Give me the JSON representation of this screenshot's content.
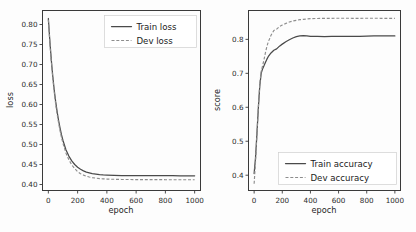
{
  "figure": {
    "background": "#fdfdfd",
    "panel_count": 2
  },
  "chart_data": [
    {
      "type": "line",
      "panel": "left",
      "title": "",
      "xlabel": "epoch",
      "ylabel": "loss",
      "xlim": [
        -40,
        1040
      ],
      "ylim": [
        0.385,
        0.835
      ],
      "xticks": [
        0,
        200,
        400,
        600,
        800,
        1000
      ],
      "xticklabels": [
        "0",
        "200",
        "400",
        "600",
        "800",
        "1000"
      ],
      "yticks": [
        0.4,
        0.45,
        0.5,
        0.55,
        0.6,
        0.65,
        0.7,
        0.75,
        0.8
      ],
      "yticklabels": [
        "0.40",
        "0.45",
        "0.50",
        "0.55",
        "0.60",
        "0.65",
        "0.70",
        "0.75",
        "0.80"
      ],
      "grid": false,
      "legend_position": "upper right",
      "legend": [
        "Train loss",
        "Dev loss"
      ],
      "x": [
        0,
        10,
        20,
        30,
        40,
        50,
        60,
        70,
        80,
        90,
        100,
        120,
        140,
        160,
        180,
        200,
        220,
        240,
        260,
        280,
        300,
        325,
        350,
        375,
        400,
        450,
        500,
        550,
        600,
        650,
        700,
        750,
        800,
        850,
        900,
        950,
        1000
      ],
      "series": [
        {
          "name": "Train loss",
          "style": "solid",
          "color": "#4a4a4a",
          "values": [
            0.815,
            0.76,
            0.712,
            0.672,
            0.637,
            0.607,
            0.582,
            0.56,
            0.541,
            0.524,
            0.51,
            0.487,
            0.471,
            0.459,
            0.45,
            0.443,
            0.438,
            0.434,
            0.431,
            0.429,
            0.427,
            0.426,
            0.4248,
            0.424,
            0.4235,
            0.4228,
            0.4224,
            0.4222,
            0.4221,
            0.422,
            0.422,
            0.4219,
            0.4219,
            0.4219,
            0.4218,
            0.4218,
            0.4218
          ]
        },
        {
          "name": "Dev loss",
          "style": "dashed",
          "color": "#8d8d8d",
          "values": [
            0.812,
            0.757,
            0.708,
            0.667,
            0.632,
            0.601,
            0.576,
            0.554,
            0.534,
            0.517,
            0.503,
            0.479,
            0.462,
            0.449,
            0.44,
            0.432,
            0.427,
            0.4235,
            0.4208,
            0.4188,
            0.4172,
            0.4158,
            0.4148,
            0.4141,
            0.4136,
            0.413,
            0.4126,
            0.4124,
            0.4123,
            0.4122,
            0.4121,
            0.4121,
            0.412,
            0.412,
            0.412,
            0.412,
            0.412
          ]
        }
      ]
    },
    {
      "type": "line",
      "panel": "right",
      "title": "",
      "xlabel": "epoch",
      "ylabel": "score",
      "xlim": [
        -40,
        1040
      ],
      "ylim": [
        0.355,
        0.885
      ],
      "xticks": [
        0,
        200,
        400,
        600,
        800,
        1000
      ],
      "xticklabels": [
        "0",
        "200",
        "400",
        "600",
        "800",
        "1000"
      ],
      "yticks": [
        0.4,
        0.5,
        0.6,
        0.7,
        0.8
      ],
      "yticklabels": [
        "0.4",
        "0.5",
        "0.6",
        "0.7",
        "0.8"
      ],
      "grid": false,
      "legend_position": "lower right",
      "legend": [
        "Train accuracy",
        "Dev accuracy"
      ],
      "x": [
        0,
        10,
        20,
        30,
        40,
        50,
        60,
        70,
        80,
        90,
        100,
        120,
        140,
        160,
        180,
        200,
        225,
        250,
        275,
        300,
        325,
        350,
        375,
        400,
        450,
        500,
        550,
        600,
        650,
        700,
        750,
        800,
        850,
        900,
        950,
        1000
      ],
      "series": [
        {
          "name": "Train accuracy",
          "style": "solid",
          "color": "#4a4a4a",
          "values": [
            0.405,
            0.452,
            0.523,
            0.598,
            0.662,
            0.7,
            0.713,
            0.722,
            0.732,
            0.741,
            0.749,
            0.76,
            0.768,
            0.772,
            0.78,
            0.786,
            0.793,
            0.799,
            0.804,
            0.808,
            0.81,
            0.811,
            0.8105,
            0.809,
            0.8085,
            0.808,
            0.8085,
            0.809,
            0.8088,
            0.8085,
            0.809,
            0.8095,
            0.81,
            0.81,
            0.8105,
            0.81
          ]
        },
        {
          "name": "Dev accuracy",
          "style": "dashed",
          "color": "#8d8d8d",
          "values": [
            0.375,
            0.44,
            0.52,
            0.6,
            0.668,
            0.706,
            0.722,
            0.74,
            0.76,
            0.778,
            0.792,
            0.812,
            0.826,
            0.83,
            0.838,
            0.842,
            0.847,
            0.851,
            0.854,
            0.856,
            0.858,
            0.859,
            0.86,
            0.861,
            0.8615,
            0.862,
            0.862,
            0.8622,
            0.8622,
            0.862,
            0.862,
            0.8622,
            0.8622,
            0.862,
            0.862,
            0.862
          ]
        }
      ]
    }
  ]
}
